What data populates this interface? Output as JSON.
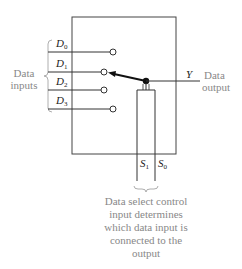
{
  "diagram": {
    "inputs_group_label": [
      "Data",
      "inputs"
    ],
    "inputs": [
      {
        "name": "D",
        "sub": "0"
      },
      {
        "name": "D",
        "sub": "1"
      },
      {
        "name": "D",
        "sub": "2"
      },
      {
        "name": "D",
        "sub": "3"
      }
    ],
    "selected_input_index": 1,
    "output": {
      "name": "Y",
      "label": [
        "Data",
        "output"
      ]
    },
    "select_lines": [
      {
        "name": "S",
        "sub": "1"
      },
      {
        "name": "S",
        "sub": "0"
      }
    ],
    "select_caption": [
      "Data select control",
      "input determines",
      "which data input is",
      "connected to the",
      "output"
    ],
    "colors": {
      "line": "#333333",
      "label": "#888888",
      "text": "#222222"
    }
  }
}
